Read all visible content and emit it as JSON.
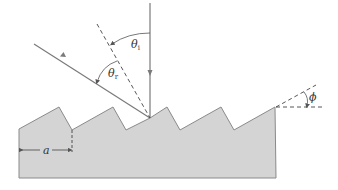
{
  "diagram": {
    "labels": {
      "theta_i": "θ",
      "theta_i_sub": "i",
      "theta_r": "θ",
      "theta_r_sub": "r",
      "phi": "ϕ",
      "a": "a"
    },
    "colors": {
      "grating_fill": "#d4d4d4",
      "grating_stroke": "#8a8a8a",
      "ray": "#7a7a7a",
      "dashed": "#444444"
    },
    "elements": [
      "incident-ray",
      "reflected-ray",
      "grating-normal",
      "sawtooth-grating",
      "groove-spacing-a",
      "blaze-angle-phi"
    ]
  }
}
